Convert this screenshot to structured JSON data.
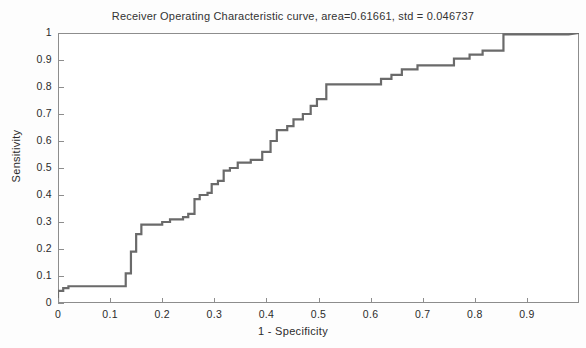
{
  "chart_data": {
    "type": "line",
    "title": "Receiver Operating Characteristic curve, area=0.61661, std = 0.046737",
    "xlabel": "1 - Specificity",
    "ylabel": "Sensitivity",
    "xlim": [
      0,
      1
    ],
    "ylim": [
      0,
      1
    ],
    "grid": false,
    "legend": null,
    "line_color": "#6a6a6a",
    "axis_color": "#8d8d8d",
    "xticks": [
      0,
      0.1,
      0.2,
      0.3,
      0.4,
      0.5,
      0.6,
      0.7,
      0.8,
      0.9
    ],
    "xtick_labels": [
      "0",
      "0.1",
      "0.2",
      "0.3",
      "0.4",
      "0.5",
      "0.6",
      "0.7",
      "0.8",
      "0.9"
    ],
    "yticks": [
      0,
      0.1,
      0.2,
      0.3,
      0.4,
      0.5,
      0.6,
      0.7,
      0.8,
      0.9,
      1
    ],
    "ytick_labels": [
      "0",
      "0.1",
      "0.2",
      "0.3",
      "0.4",
      "0.5",
      "0.6",
      "0.7",
      "0.8",
      "0.9",
      "1"
    ],
    "annotations": {
      "area": "0.61661",
      "std": "0.046737"
    },
    "series": [
      {
        "name": "ROC curve",
        "step": "post",
        "x": [
          0.0,
          0.0,
          0.01,
          0.01,
          0.02,
          0.02,
          0.13,
          0.13,
          0.14,
          0.14,
          0.15,
          0.15,
          0.16,
          0.16,
          0.2,
          0.2,
          0.215,
          0.215,
          0.24,
          0.24,
          0.25,
          0.25,
          0.262,
          0.262,
          0.272,
          0.272,
          0.287,
          0.287,
          0.295,
          0.295,
          0.307,
          0.307,
          0.318,
          0.318,
          0.33,
          0.33,
          0.345,
          0.345,
          0.37,
          0.37,
          0.392,
          0.392,
          0.408,
          0.408,
          0.42,
          0.42,
          0.44,
          0.44,
          0.452,
          0.452,
          0.47,
          0.47,
          0.485,
          0.485,
          0.497,
          0.497,
          0.515,
          0.515,
          0.62,
          0.62,
          0.64,
          0.64,
          0.66,
          0.66,
          0.69,
          0.69,
          0.76,
          0.76,
          0.79,
          0.79,
          0.815,
          0.815,
          0.855,
          0.855,
          0.98,
          1.0
        ],
        "y": [
          0.0,
          0.045,
          0.045,
          0.055,
          0.055,
          0.062,
          0.062,
          0.11,
          0.11,
          0.19,
          0.19,
          0.255,
          0.255,
          0.29,
          0.29,
          0.3,
          0.3,
          0.31,
          0.31,
          0.318,
          0.318,
          0.33,
          0.33,
          0.385,
          0.385,
          0.4,
          0.4,
          0.408,
          0.408,
          0.44,
          0.44,
          0.452,
          0.452,
          0.49,
          0.49,
          0.5,
          0.5,
          0.52,
          0.52,
          0.53,
          0.53,
          0.56,
          0.56,
          0.6,
          0.6,
          0.64,
          0.64,
          0.655,
          0.655,
          0.68,
          0.68,
          0.7,
          0.7,
          0.73,
          0.73,
          0.755,
          0.755,
          0.81,
          0.81,
          0.83,
          0.83,
          0.845,
          0.845,
          0.865,
          0.865,
          0.88,
          0.88,
          0.905,
          0.905,
          0.92,
          0.92,
          0.935,
          0.935,
          0.995,
          0.995,
          1.0
        ]
      }
    ]
  }
}
